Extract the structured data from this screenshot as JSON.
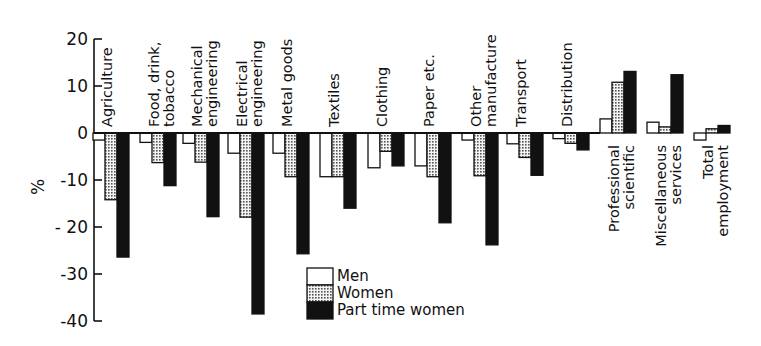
{
  "chart_data": {
    "type": "bar",
    "title": "",
    "xlabel": "",
    "ylabel": "%",
    "ylim": [
      -40,
      20
    ],
    "yticks": [
      20,
      10,
      0,
      -10,
      -20,
      -30,
      -40
    ],
    "grid": false,
    "legend_position": "bottom-center (inside plot)",
    "categories": [
      "Agriculture",
      "Food, drink, tobacco",
      "Mechanical engineering",
      "Electrical engineering",
      "Metal goods",
      "Textiles",
      "Clothing",
      "Paper etc.",
      "Other manufacture",
      "Transport",
      "Distribution",
      "Professional scientific",
      "Miscellaneous services",
      "Total employment"
    ],
    "category_label_lines": [
      [
        "Agriculture"
      ],
      [
        "Food, drink,",
        "tobacco"
      ],
      [
        "Mechanical",
        "engineering"
      ],
      [
        "Electrical",
        "engineering"
      ],
      [
        "Metal  goods"
      ],
      [
        "Textiles"
      ],
      [
        "Clothing"
      ],
      [
        "Paper etc."
      ],
      [
        "Other",
        "manufacture"
      ],
      [
        "Transport"
      ],
      [
        "Distribution"
      ],
      [
        "Professional",
        "scientific"
      ],
      [
        "Miscellaneous",
        "services"
      ],
      [
        "Total",
        "employment"
      ]
    ],
    "series": [
      {
        "name": "Men",
        "fill": "white",
        "values": [
          -1.5,
          -2,
          -2.2,
          -4.3,
          -4.3,
          -9.3,
          -7.4,
          -7,
          -1.5,
          -2.3,
          -1.2,
          3,
          2.3,
          -1.5
        ]
      },
      {
        "name": "Women",
        "fill": "dotted",
        "values": [
          -14.2,
          -6.3,
          -6.2,
          -17.9,
          -9.3,
          -9.3,
          -3.9,
          -9.3,
          -9.1,
          -5.2,
          -2.2,
          10.8,
          1.3,
          0.9
        ]
      },
      {
        "name": "Part time women",
        "fill": "black",
        "values": [
          -26.4,
          -11.2,
          -17.8,
          -38.5,
          -25.7,
          -16,
          -7,
          -19.1,
          -23.8,
          -9,
          -3.6,
          13.1,
          12.4,
          1.6
        ]
      }
    ]
  },
  "legend": {
    "items": [
      {
        "label": "Men"
      },
      {
        "label": "Women"
      },
      {
        "label": "Part time women"
      }
    ]
  },
  "axis": {
    "ylabel": "%",
    "ticks": [
      "20",
      "10",
      "0",
      "-10",
      "- 20",
      "-30",
      "-40"
    ]
  },
  "colors": {
    "ink": "#111111",
    "background": "#ffffff",
    "dot_fill": "#f2f2f2",
    "dot_color": "#555555"
  }
}
